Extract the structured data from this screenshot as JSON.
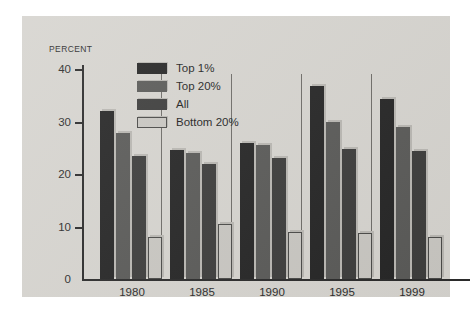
{
  "chart_data": {
    "type": "bar",
    "title": "",
    "subtitle": "",
    "xlabel": "",
    "ylabel": "PERCENT",
    "ylim": [
      0,
      40
    ],
    "yticks": [
      0,
      10,
      20,
      30,
      40
    ],
    "ytick_labels": [
      "0",
      "10",
      "20",
      "30",
      "40"
    ],
    "grid": false,
    "legend_position": "top-left-inside",
    "categories": [
      "1980",
      "1985",
      "1990",
      "1995",
      "1999"
    ],
    "series": [
      {
        "name": "Top 1%",
        "color": "#262626",
        "values": [
          32.0,
          24.5,
          26.0,
          36.8,
          34.3
        ]
      },
      {
        "name": "Top 20%",
        "color": "#5a5a58",
        "values": [
          27.8,
          24.0,
          25.5,
          30.0,
          29.0
        ]
      },
      {
        "name": "All",
        "color": "#3d3d3c",
        "values": [
          23.5,
          22.0,
          23.0,
          24.8,
          24.3
        ]
      },
      {
        "name": "Bottom 20%",
        "color": "#c9c7c2",
        "values": [
          8.0,
          10.5,
          9.0,
          8.8,
          8.0
        ]
      }
    ],
    "annotations": []
  },
  "colors": {
    "panel_background": "#d6d4cf",
    "page_background": "#ffffff",
    "axis": "#2b2b2b",
    "separator": "#6e6c68",
    "bar_shadow": "#b9b7b2"
  }
}
